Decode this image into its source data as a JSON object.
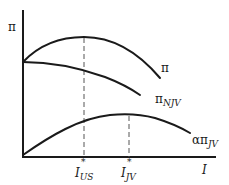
{
  "diagram": {
    "y_axis_label": "π",
    "x_axis_label": "I",
    "curves": [
      {
        "id": "pi",
        "label": "π",
        "shape": "concave, peaks at I*_US"
      },
      {
        "id": "pi_njv",
        "label_main": "π",
        "label_sub": "NJV",
        "shape": "declining from same intercept as π"
      },
      {
        "id": "alpha_pi_jv",
        "label_main": "απ",
        "label_sub": "JV",
        "shape": "concave from origin, peaks at I*_JV"
      }
    ],
    "markers": [
      {
        "id": "i_us",
        "main": "I",
        "star": "*",
        "sub": "US"
      },
      {
        "id": "i_jv",
        "main": "I",
        "star": "*",
        "sub": "JV"
      }
    ]
  },
  "colors": {
    "line": "#1a1a1a",
    "dashed": "#555555",
    "background": "#ffffff"
  }
}
